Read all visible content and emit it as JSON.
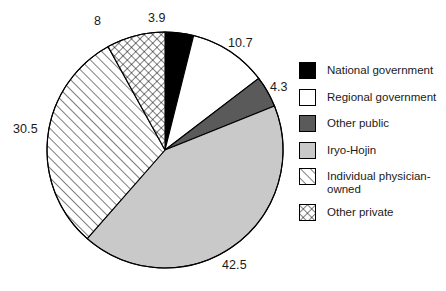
{
  "chart_data": {
    "type": "pie",
    "title": "",
    "categories": [
      "National government",
      "Regional government",
      "Other public",
      "Iryo-Hojin",
      "Individual physician-owned",
      "Other private"
    ],
    "values": [
      3.9,
      10.7,
      4.3,
      42.5,
      30.5,
      8
    ],
    "data_labels": [
      "3.9",
      "10.7",
      "4.3",
      "42.5",
      "30.5",
      "8"
    ],
    "units": "percent",
    "start_angle_deg": 0,
    "direction": "clockwise",
    "legend_position": "right",
    "grid": false,
    "slice_styles": [
      {
        "name": "National government",
        "fill": "#000000",
        "pattern": "solid",
        "stroke": "#000000"
      },
      {
        "name": "Regional government",
        "fill": "#ffffff",
        "pattern": "solid",
        "stroke": "#000000"
      },
      {
        "name": "Other public",
        "fill": "#5a5a5a",
        "pattern": "solid",
        "stroke": "#000000"
      },
      {
        "name": "Iryo-Hojin",
        "fill": "#c9c9c9",
        "pattern": "solid",
        "stroke": "#000000"
      },
      {
        "name": "Individual physician-owned",
        "fill": "#ffffff",
        "pattern": "diagonal-hatch",
        "stroke": "#000000"
      },
      {
        "name": "Other private",
        "fill": "#ffffff",
        "pattern": "cross-hatch",
        "stroke": "#000000"
      }
    ]
  },
  "legend": {
    "items": [
      {
        "label": "National government"
      },
      {
        "label": "Regional government"
      },
      {
        "label": "Other public"
      },
      {
        "label": "Iryo-Hojin"
      },
      {
        "label": "Individual physician-owned"
      },
      {
        "label": "Other private"
      }
    ]
  },
  "labels": {
    "national_government": "3.9",
    "regional_government": "10.7",
    "other_public": "4.3",
    "iryo_hojin": "42.5",
    "individual_physician_owned": "30.5",
    "other_private": "8"
  },
  "colors": {
    "black": "#000000",
    "white": "#ffffff",
    "dark_gray": "#5a5a5a",
    "light_gray": "#c9c9c9",
    "outline": "#000000",
    "text": "#1a1a1a"
  }
}
